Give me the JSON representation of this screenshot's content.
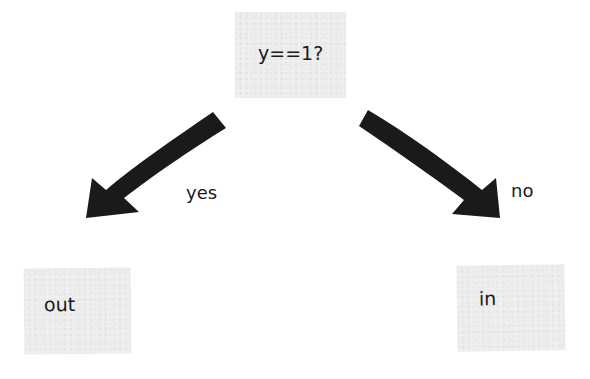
{
  "diagram": {
    "type": "decision-tree",
    "nodes": {
      "decision": {
        "label": "y==1?"
      },
      "left": {
        "label": "out"
      },
      "right": {
        "label": "in"
      }
    },
    "edges": [
      {
        "from": "decision",
        "to": "left",
        "label": "yes"
      },
      {
        "from": "decision",
        "to": "right",
        "label": "no"
      }
    ],
    "colors": {
      "node_fill": "#efefef",
      "arrow": "#1a1a1a",
      "text": "#1a1a1a"
    }
  }
}
